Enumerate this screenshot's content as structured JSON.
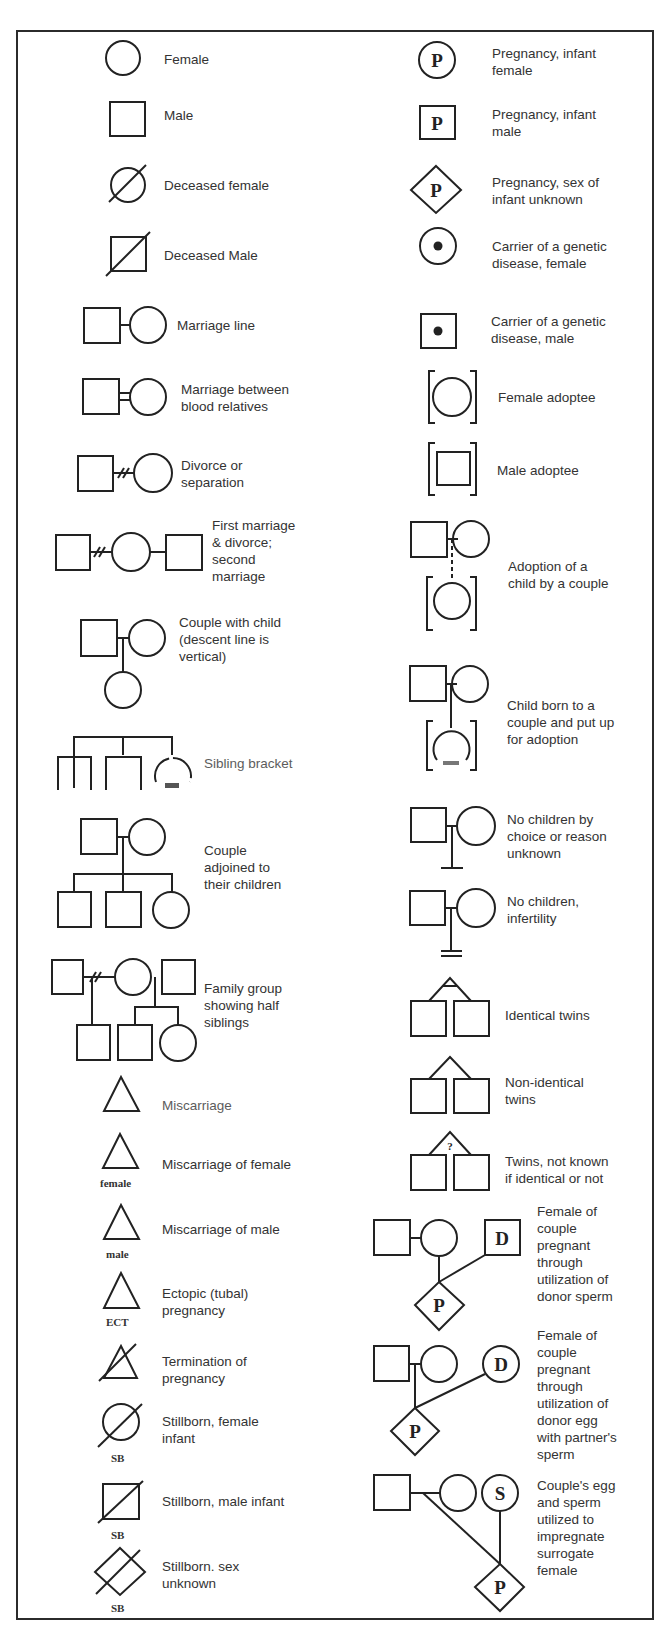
{
  "left_column": [
    {
      "id": "female",
      "label": "Female"
    },
    {
      "id": "male",
      "label": "Male"
    },
    {
      "id": "deceased-female",
      "label": "Deceased female"
    },
    {
      "id": "deceased-male",
      "label": "Deceased Male"
    },
    {
      "id": "marriage-line",
      "label": "Marriage line"
    },
    {
      "id": "consanguineous",
      "label": "Marriage between\nblood relatives"
    },
    {
      "id": "divorce",
      "label": "Divorce or\nseparation"
    },
    {
      "id": "first-marriage",
      "label": "First marriage\n& divorce;\nsecond\nmarriage"
    },
    {
      "id": "couple-with-child",
      "label": "Couple with child\n(descent line is\nvertical)"
    },
    {
      "id": "sibling-bracket",
      "label": "Sibling bracket"
    },
    {
      "id": "couple-children",
      "label": "Couple\nadjoined to\ntheir children"
    },
    {
      "id": "half-siblings",
      "label": "Family group\nshowing half\nsiblings"
    },
    {
      "id": "miscarriage",
      "label": "Miscarriage"
    },
    {
      "id": "miscarriage-female",
      "label": "Miscarriage of female",
      "sub": "female"
    },
    {
      "id": "miscarriage-male",
      "label": "Miscarriage of male",
      "sub": "male"
    },
    {
      "id": "ectopic",
      "label": "Ectopic (tubal)\npregnancy",
      "sub": "ECT"
    },
    {
      "id": "termination",
      "label": "Termination of\npregnancy"
    },
    {
      "id": "stillborn-female",
      "label": "Stillborn, female\ninfant",
      "sub": "SB"
    },
    {
      "id": "stillborn-male",
      "label": "Stillborn, male infant",
      "sub": "SB"
    },
    {
      "id": "stillborn-unknown",
      "label": "Stillborn. sex\nunknown",
      "sub": "SB"
    }
  ],
  "right_column": [
    {
      "id": "pregnancy-female",
      "label": "Pregnancy, infant\nfemale",
      "glyph": "P"
    },
    {
      "id": "pregnancy-male",
      "label": "Pregnancy, infant\nmale",
      "glyph": "P"
    },
    {
      "id": "pregnancy-unknown",
      "label": "Pregnancy, sex of\ninfant unknown",
      "glyph": "P"
    },
    {
      "id": "carrier-female",
      "label": "Carrier of a genetic\ndisease, female"
    },
    {
      "id": "carrier-male",
      "label": "Carrier of a genetic\ndisease, male"
    },
    {
      "id": "female-adoptee",
      "label": "Female adoptee"
    },
    {
      "id": "male-adoptee",
      "label": "Male adoptee"
    },
    {
      "id": "adoption-by-couple",
      "label": "Adoption of a\nchild by a couple"
    },
    {
      "id": "put-up-for-adoption",
      "label": "Child born to a\ncouple and put up\nfor adoption"
    },
    {
      "id": "no-children-choice",
      "label": "No children by\nchoice or reason\nunknown"
    },
    {
      "id": "no-children-infertility",
      "label": "No children,\ninfertility"
    },
    {
      "id": "identical-twins",
      "label": "Identical twins"
    },
    {
      "id": "nonidentical-twins",
      "label": "Non-identical\ntwins"
    },
    {
      "id": "twins-unknown",
      "label": "Twins, not known\nif identical or not",
      "glyph": "?"
    },
    {
      "id": "donor-sperm",
      "label": "Female of\ncouple\npregnant\nthrough\nutilization of\ndonor sperm",
      "glyphs": [
        "D",
        "P"
      ]
    },
    {
      "id": "donor-egg",
      "label": "Female of\ncouple\npregnant\nthrough\nutilization of\ndonor egg\nwith partner's\nsperm",
      "glyphs": [
        "D",
        "P"
      ]
    },
    {
      "id": "surrogate",
      "label": "Couple's egg\nand sperm\nutilized to\nimpregnate\nsurrogate\nfemale",
      "glyphs": [
        "S",
        "P"
      ]
    }
  ]
}
